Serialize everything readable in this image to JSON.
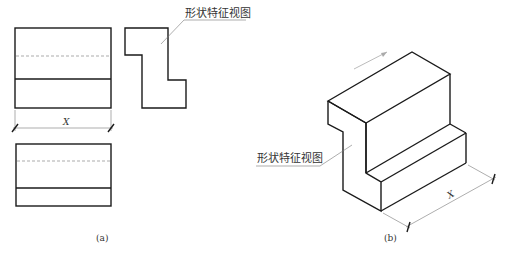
{
  "figure_a": {
    "caption": "(a)",
    "leader_label": "形状特征视图",
    "dimension_label": "X"
  },
  "figure_b": {
    "caption": "(b)",
    "leader_label": "形状特征视图",
    "dimension_label": "X"
  },
  "colors": {
    "line": "#1a1a1a",
    "thin_line": "#777777",
    "background": "#ffffff"
  }
}
